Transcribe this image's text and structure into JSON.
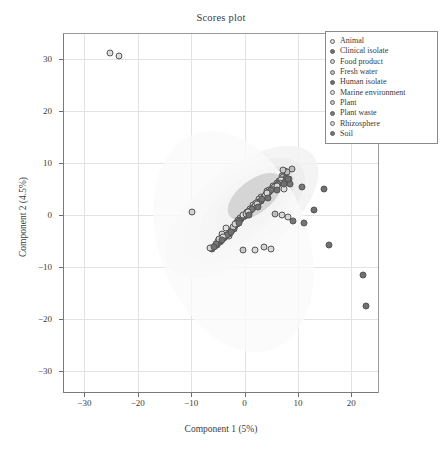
{
  "chart_data": {
    "type": "scatter",
    "title": "Scores plot",
    "xlabel": "Component 1 (5%)",
    "ylabel": "Component 2 (4.5%)",
    "xlim": [
      -34,
      25
    ],
    "ylim": [
      -34,
      35
    ],
    "xticks": [
      -30,
      -20,
      -10,
      0,
      10,
      20
    ],
    "yticks": [
      30,
      20,
      10,
      0,
      -10,
      -20,
      -30
    ],
    "xtick_labels": [
      "−30",
      "−20",
      "−10",
      "0",
      "10",
      "20"
    ],
    "ytick_labels": [
      "30",
      "20",
      "10",
      "0",
      "−10",
      "−20",
      "−30"
    ],
    "grid": true,
    "legend_position": "top-right",
    "legend": [
      {
        "label": "Animal",
        "color": "#dcdcdc"
      },
      {
        "label": "Clinical isolate",
        "color": "#6e6e6e"
      },
      {
        "label": "Food product",
        "color": "#d2d2d2"
      },
      {
        "label": "Fresh water",
        "color": "#bdbdbd"
      },
      {
        "label": "Human isolate",
        "color": "#6a6a6a"
      },
      {
        "label": "Marine environment",
        "color": "#e0e0e0"
      },
      {
        "label": "Plant",
        "color": "#c8c8c8"
      },
      {
        "label": "Plant waste",
        "color": "#767676"
      },
      {
        "label": "Rhizosphere",
        "color": "#d8d8d8"
      },
      {
        "label": "Soil",
        "color": "#707070"
      }
    ],
    "ellipses": [
      {
        "cx": -0.5,
        "cy": 0.5,
        "rx": 17.0,
        "ry": 8.5,
        "rot": -38,
        "fill": "#f2f2f2",
        "opacity": 0.85
      },
      {
        "cx": 0.0,
        "cy": 1.0,
        "rx": 13.5,
        "ry": 6.8,
        "rot": -38,
        "fill": "#ededed",
        "opacity": 0.9
      },
      {
        "cx": 0.5,
        "cy": 1.5,
        "rx": 10.5,
        "ry": 5.2,
        "rot": -38,
        "fill": "#e3e3e3",
        "opacity": 0.9
      },
      {
        "cx": 1.0,
        "cy": 2.0,
        "rx": 7.5,
        "ry": 4.0,
        "rot": -38,
        "fill": "#d8d8d8",
        "opacity": 0.9
      },
      {
        "cx": -2.0,
        "cy": -5.0,
        "rx": 14.0,
        "ry": 22.0,
        "rot": -20,
        "fill": "#fafafa",
        "opacity": 0.8
      },
      {
        "cx": 2.0,
        "cy": 3.5,
        "rx": 6.0,
        "ry": 3.2,
        "rot": -38,
        "fill": "#cfcfcf",
        "opacity": 0.85
      }
    ],
    "series": [
      {
        "name": "Animal",
        "color": "#dcdcdc",
        "points": [
          [
            -25.2,
            31.2
          ],
          [
            -23.5,
            30.6
          ],
          [
            -6.2,
            -6.3
          ],
          [
            -3.0,
            -4.0
          ],
          [
            -1.2,
            -1.0
          ],
          [
            0.4,
            0.6
          ],
          [
            1.6,
            2.0
          ],
          [
            3.0,
            3.4
          ],
          [
            4.2,
            4.6
          ],
          [
            5.4,
            5.6
          ],
          [
            6.4,
            6.6
          ],
          [
            7.0,
            7.6
          ],
          [
            7.6,
            8.4
          ],
          [
            2.0,
            -6.8
          ],
          [
            5.0,
            -6.6
          ]
        ]
      },
      {
        "name": "Clinical isolate",
        "color": "#6e6e6e",
        "points": [
          [
            -5.6,
            -6.0
          ],
          [
            -4.6,
            -5.2
          ],
          [
            -3.8,
            -4.4
          ],
          [
            -3.0,
            -3.6
          ],
          [
            -2.4,
            -2.8
          ],
          [
            -1.8,
            -2.0
          ],
          [
            -1.2,
            -1.4
          ],
          [
            -0.6,
            -0.8
          ],
          [
            0.0,
            -0.2
          ],
          [
            0.6,
            0.4
          ],
          [
            1.2,
            1.0
          ],
          [
            1.8,
            1.6
          ],
          [
            2.4,
            2.2
          ],
          [
            3.0,
            2.8
          ],
          [
            3.6,
            3.4
          ],
          [
            4.2,
            4.0
          ],
          [
            4.8,
            4.6
          ],
          [
            5.4,
            5.2
          ],
          [
            6.0,
            5.8
          ],
          [
            6.6,
            6.4
          ]
        ]
      },
      {
        "name": "Food product",
        "color": "#d2d2d2",
        "points": [
          [
            -9.8,
            0.6
          ],
          [
            -4.2,
            -3.6
          ],
          [
            -1.6,
            -1.6
          ],
          [
            0.8,
            0.8
          ],
          [
            2.6,
            2.6
          ],
          [
            4.4,
            4.2
          ],
          [
            6.2,
            6.0
          ],
          [
            7.4,
            7.2
          ],
          [
            3.6,
            -6.2
          ]
        ]
      },
      {
        "name": "Fresh water",
        "color": "#bdbdbd",
        "points": [
          [
            -5.0,
            -5.0
          ],
          [
            -2.8,
            -3.0
          ],
          [
            -0.8,
            -0.6
          ],
          [
            1.0,
            1.2
          ],
          [
            2.8,
            3.0
          ],
          [
            4.6,
            4.8
          ],
          [
            6.0,
            6.2
          ],
          [
            7.2,
            7.4
          ],
          [
            8.0,
            8.2
          ],
          [
            8.8,
            8.8
          ],
          [
            5.8,
            0.2
          ]
        ]
      },
      {
        "name": "Human isolate",
        "color": "#6a6a6a",
        "points": [
          [
            -6.0,
            -6.6
          ],
          [
            -5.2,
            -5.8
          ],
          [
            -4.4,
            -5.0
          ],
          [
            -3.6,
            -4.2
          ],
          [
            -2.8,
            -3.4
          ],
          [
            -2.0,
            -2.6
          ],
          [
            -1.4,
            -1.8
          ],
          [
            -0.8,
            -1.0
          ],
          [
            -0.2,
            -0.4
          ],
          [
            0.4,
            0.2
          ],
          [
            1.0,
            0.8
          ],
          [
            1.6,
            1.4
          ],
          [
            2.2,
            2.0
          ],
          [
            2.8,
            2.6
          ],
          [
            3.4,
            3.2
          ],
          [
            4.0,
            3.8
          ],
          [
            4.6,
            4.4
          ],
          [
            5.2,
            5.0
          ],
          [
            5.8,
            5.6
          ],
          [
            6.4,
            6.2
          ],
          [
            7.0,
            6.8
          ],
          [
            7.8,
            7.2
          ]
        ]
      },
      {
        "name": "Marine environment",
        "color": "#e0e0e0",
        "points": [
          [
            -3.4,
            -2.4
          ],
          [
            -0.2,
            0.0
          ],
          [
            2.2,
            2.4
          ],
          [
            4.0,
            4.0
          ],
          [
            5.6,
            5.4
          ],
          [
            6.8,
            6.8
          ],
          [
            7.4,
            5.0
          ]
        ]
      },
      {
        "name": "Plant",
        "color": "#c8c8c8",
        "points": [
          [
            -4.8,
            -4.6
          ],
          [
            -2.2,
            -2.2
          ],
          [
            0.2,
            0.2
          ],
          [
            2.0,
            1.8
          ],
          [
            3.8,
            3.6
          ],
          [
            5.2,
            5.0
          ],
          [
            6.6,
            6.2
          ],
          [
            7.2,
            8.6
          ],
          [
            8.4,
            7.0
          ],
          [
            -0.2,
            -6.8
          ]
        ]
      },
      {
        "name": "Plant waste",
        "color": "#767676",
        "points": [
          [
            -5.4,
            -5.6
          ],
          [
            -3.2,
            -3.8
          ],
          [
            -1.0,
            -1.2
          ],
          [
            1.4,
            1.2
          ],
          [
            3.2,
            3.0
          ],
          [
            5.0,
            4.8
          ],
          [
            6.2,
            6.0
          ],
          [
            7.6,
            6.4
          ],
          [
            8.6,
            6.0
          ],
          [
            10.8,
            5.4
          ],
          [
            11.2,
            -1.6
          ],
          [
            9.0,
            -1.2
          ]
        ]
      },
      {
        "name": "Rhizosphere",
        "color": "#d8d8d8",
        "points": [
          [
            -6.4,
            -6.4
          ],
          [
            -4.0,
            -4.2
          ],
          [
            -1.8,
            -1.8
          ],
          [
            0.6,
            0.6
          ],
          [
            2.4,
            2.2
          ],
          [
            4.2,
            4.2
          ],
          [
            6.0,
            5.6
          ],
          [
            7.0,
            0.0
          ],
          [
            8.2,
            -0.4
          ]
        ]
      },
      {
        "name": "Soil",
        "color": "#707070",
        "points": [
          [
            -5.8,
            -6.2
          ],
          [
            -4.2,
            -4.8
          ],
          [
            -2.6,
            -3.2
          ],
          [
            -1.0,
            -1.6
          ],
          [
            0.8,
            0.0
          ],
          [
            2.6,
            1.6
          ],
          [
            4.4,
            3.2
          ],
          [
            6.0,
            4.8
          ],
          [
            7.4,
            6.0
          ],
          [
            8.2,
            7.0
          ],
          [
            14.8,
            5.0
          ],
          [
            15.8,
            -5.8
          ],
          [
            22.2,
            -11.6
          ],
          [
            22.8,
            -17.4
          ],
          [
            13.0,
            1.0
          ]
        ]
      }
    ]
  }
}
